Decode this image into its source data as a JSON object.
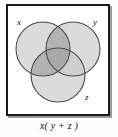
{
  "figure": {
    "caption": "x( y + z )",
    "frame_color": "#1a1a1a",
    "background_color": "#ffffff"
  },
  "diagram": {
    "type": "venn",
    "sets": [
      {
        "id": "x",
        "label": "x",
        "cx": 37,
        "cy": 45,
        "r": 27,
        "position": "upper-left"
      },
      {
        "id": "y",
        "label": "y",
        "cx": 67,
        "cy": 45,
        "r": 27,
        "position": "upper-right"
      },
      {
        "id": "z",
        "label": "z",
        "cx": 52,
        "cy": 71,
        "r": 27,
        "position": "bottom"
      }
    ],
    "fill_light": "#d9d9d7",
    "fill_dark": "#b0b0ae",
    "fill_darkest": "#9a9a98",
    "stroke": "#4a4a4a",
    "shaded_regions": [
      "x-and-y",
      "x-and-z",
      "x-and-y-and-z"
    ],
    "expression": "x(y + z)"
  }
}
